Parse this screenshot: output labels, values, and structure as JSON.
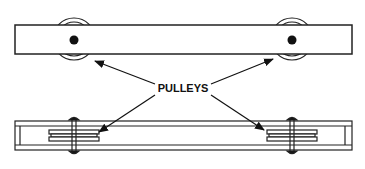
{
  "diagram": {
    "label": "PULLEYS",
    "views": [
      {
        "name": "top-view",
        "description": "bar with two pulleys seen face-on"
      },
      {
        "name": "side-view",
        "description": "channel with two pulleys seen edge-on"
      }
    ],
    "colors": {
      "line": "#222222",
      "background": "#ffffff",
      "fill": "#111111"
    }
  }
}
